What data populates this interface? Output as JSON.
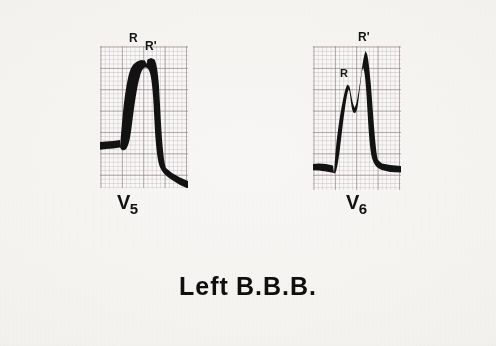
{
  "figure": {
    "caption": "Left B.B.B.",
    "caption_part_1": "Left",
    "caption_part_2": "B.B.B.",
    "background_color": "#f4f3f0",
    "trace_color": "#121212",
    "grid_major_color": "#968484",
    "grid_minor_color": "#b0a0a0",
    "strip_background_color": "#fbfafa"
  },
  "panels": [
    {
      "id": "v5",
      "lead_letter": "V",
      "lead_subscript": "5",
      "lead_label": "V5",
      "annotations": [
        {
          "id": "r",
          "text": "R"
        },
        {
          "id": "r-prime",
          "text": "R'"
        }
      ]
    },
    {
      "id": "v6",
      "lead_letter": "V",
      "lead_subscript": "6",
      "lead_label": "V6",
      "annotations": [
        {
          "id": "r",
          "text": "R"
        },
        {
          "id": "r-prime",
          "text": "R'"
        }
      ]
    }
  ]
}
